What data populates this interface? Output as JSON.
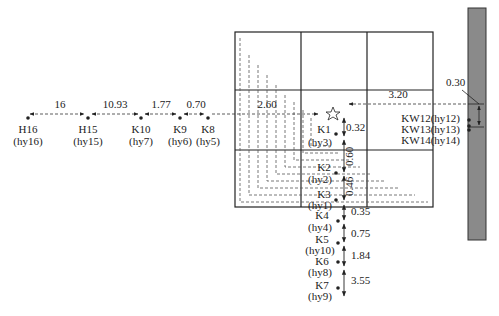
{
  "diagram": {
    "colors": {
      "line": "#222222",
      "dash": "#555555",
      "wall": "#8a8a8a",
      "wall_border": "#333333"
    },
    "left_chain": {
      "distances": [
        "16",
        "10.93",
        "1.77",
        "0.70",
        "2.60"
      ],
      "points": [
        {
          "name": "H16",
          "alias": "(hy16)"
        },
        {
          "name": "H15",
          "alias": "(hy15)"
        },
        {
          "name": "K10",
          "alias": "(hy7)"
        },
        {
          "name": "K9",
          "alias": "(hy6)"
        },
        {
          "name": "K8",
          "alias": "(hy5)"
        }
      ]
    },
    "grid_points": [
      {
        "name": "K1",
        "alias": "(hy3)"
      },
      {
        "name": "K2",
        "alias": "(hy2)"
      },
      {
        "name": "K3",
        "alias": "(hy1)"
      }
    ],
    "grid_distances": {
      "k1_to_star": "0.32",
      "k1_to_k2": "0.60",
      "k2_to_k3": "0.46"
    },
    "lower_chain": {
      "points": [
        {
          "name": "K4",
          "alias": "(hy4)"
        },
        {
          "name": "K5",
          "alias": "(hy10)"
        },
        {
          "name": "K6",
          "alias": "(hy8)"
        },
        {
          "name": "K7",
          "alias": "(hy9)"
        }
      ],
      "distances": [
        "0.35",
        "0.75",
        "1.84",
        "3.55"
      ]
    },
    "right_side": {
      "distance_to_wall": "3.20",
      "wall_offset": "0.30",
      "points": [
        "KW12(hy12)",
        "KW13(hy13)",
        "KW14(hy14)"
      ]
    },
    "icons": {
      "origin": "star-icon"
    }
  }
}
